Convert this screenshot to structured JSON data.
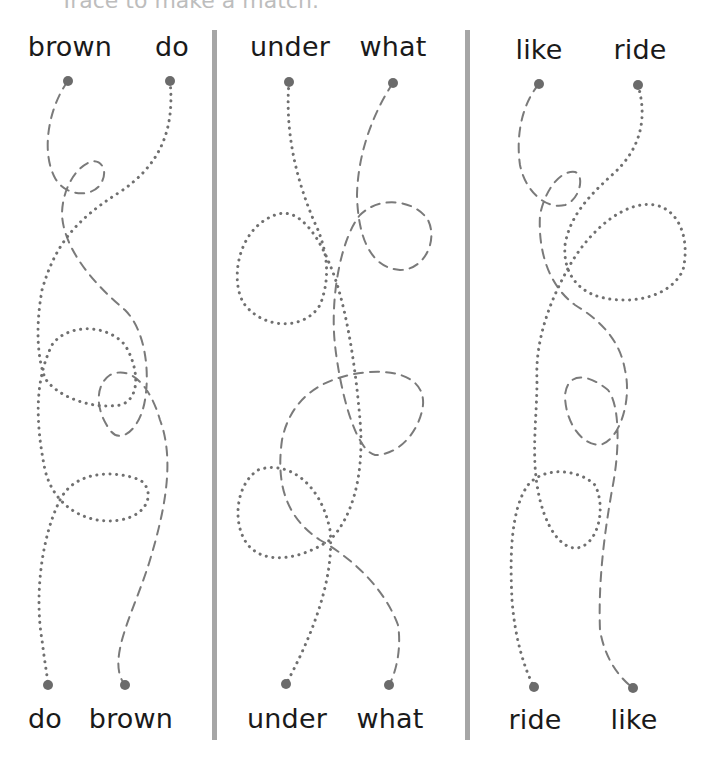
{
  "instruction": "Trace to make a match.",
  "colors": {
    "line": "#7a7a7a",
    "endpoint": "#6b6b6b",
    "divider": "#a6a6a6",
    "text": "#1a1a1a"
  },
  "columns": [
    {
      "top_words": [
        "brown",
        "do"
      ],
      "bottom_words": [
        "do",
        "brown"
      ],
      "paths": [
        {
          "from": "brown",
          "to": "brown",
          "style": "dashed"
        },
        {
          "from": "do",
          "to": "do",
          "style": "dotted"
        }
      ]
    },
    {
      "top_words": [
        "under",
        "what"
      ],
      "bottom_words": [
        "under",
        "what"
      ],
      "paths": [
        {
          "from": "under",
          "to": "under",
          "style": "dotted"
        },
        {
          "from": "what",
          "to": "what",
          "style": "dashed"
        }
      ]
    },
    {
      "top_words": [
        "like",
        "ride"
      ],
      "bottom_words": [
        "ride",
        "like"
      ],
      "paths": [
        {
          "from": "like",
          "to": "like",
          "style": "dashed"
        },
        {
          "from": "ride",
          "to": "ride",
          "style": "dotted"
        }
      ]
    }
  ]
}
